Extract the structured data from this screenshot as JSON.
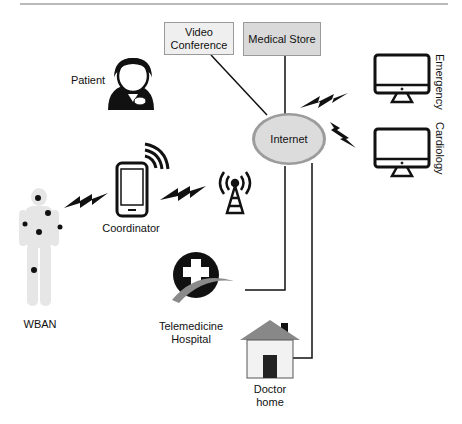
{
  "diagram": {
    "type": "network-architecture",
    "topic": "WBAN telemedicine system"
  },
  "nodes": {
    "video_conference": {
      "label_line1": "Video",
      "label_line2": "Conference",
      "fill": "#efefef"
    },
    "medical_store": {
      "label": "Medical Store",
      "fill": "#d9d9d9"
    },
    "internet": {
      "label": "Internet",
      "fill": "#dcdcdc",
      "stroke": "#9c9c9c"
    },
    "patient": {
      "label": "Patient"
    },
    "emergency": {
      "label": "Emergency"
    },
    "cardiology": {
      "label": "Cardiology"
    },
    "coordinator": {
      "label": "Coordinator"
    },
    "wban": {
      "label": "WBAN"
    },
    "hospital": {
      "label_line1": "Telemedicine",
      "label_line2": "Hospital"
    },
    "doctor_home": {
      "label_line1": "Doctor",
      "label_line2": "home"
    }
  },
  "colors": {
    "line": "#111111",
    "icon": "#111111",
    "body": "#e6e6e6"
  }
}
